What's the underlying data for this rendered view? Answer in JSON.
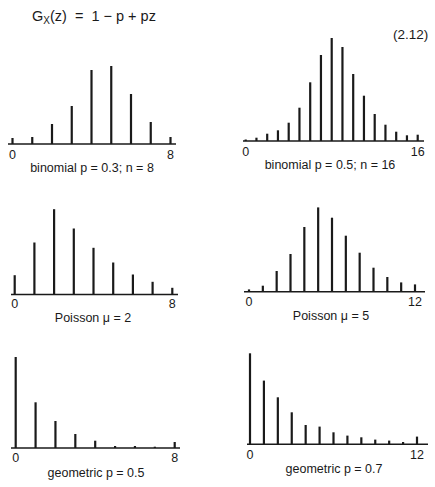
{
  "equation": {
    "lhs_main": "G",
    "lhs_sub": "X",
    "rhs": "(z)  =  1 − p + pz",
    "number": "(2.12)"
  },
  "style": {
    "ink": "#1a1a1a",
    "background": "#ffffff"
  },
  "chart_data": [
    {
      "type": "bar",
      "title": "binomial p = 0.3; n = 8",
      "x": [
        0,
        1,
        2,
        3,
        4,
        5,
        6,
        7,
        8
      ],
      "values": [
        6,
        7,
        20,
        38,
        74,
        78,
        50,
        22,
        7
      ],
      "xtick_labels": [
        "0",
        "8"
      ],
      "xlim": [
        0,
        8
      ],
      "units": "pixel heights (relative probability)",
      "layout": {
        "x0": 12.5,
        "x1": 170.5,
        "baseline": 144,
        "axis_from": 8,
        "axis_to": 176,
        "label_y": 148,
        "caption_x": 92,
        "caption_y": 161
      }
    },
    {
      "type": "bar",
      "title": "binomial p = 0.5; n = 16",
      "x": [
        0,
        1,
        2,
        3,
        4,
        5,
        6,
        7,
        8,
        9,
        10,
        11,
        12,
        13,
        14,
        15,
        16
      ],
      "values": [
        1.5,
        3.3,
        7.3,
        10.7,
        18.3,
        33.3,
        58.7,
        86,
        103,
        94,
        67,
        45.3,
        27,
        16.3,
        9.3,
        5.7,
        6.3
      ],
      "xtick_labels": [
        "0",
        "16"
      ],
      "xlim": [
        0,
        16
      ],
      "units": "pixel heights (relative probability)",
      "layout": {
        "x0": 245.7,
        "x1": 417.7,
        "baseline": 141,
        "axis_from": 243,
        "axis_to": 424,
        "label_y": 145,
        "caption_x": 330,
        "caption_y": 158
      }
    },
    {
      "type": "bar",
      "title": "Poisson μ = 2",
      "x": [
        0,
        1,
        2,
        3,
        4,
        5,
        6,
        7,
        8
      ],
      "values": [
        19.3,
        52,
        85.3,
        66,
        46.7,
        32,
        20,
        12.7,
        6.7
      ],
      "xtick_labels": [
        "0",
        "8"
      ],
      "xlim": [
        0,
        8
      ],
      "units": "pixel heights (relative probability)",
      "layout": {
        "x0": 14.7,
        "x1": 172.3,
        "baseline": 294.5,
        "axis_from": 11,
        "axis_to": 178,
        "label_y": 297,
        "caption_x": 93,
        "caption_y": 311
      }
    },
    {
      "type": "bar",
      "title": "Poisson μ = 5",
      "x": [
        0,
        1,
        2,
        3,
        4,
        5,
        6,
        7,
        8,
        9,
        10,
        11,
        12
      ],
      "values": [
        2.3,
        6,
        20.7,
        37.7,
        64.7,
        84.3,
        74,
        56,
        39,
        24,
        14.7,
        9.3,
        7.3
      ],
      "xtick_labels": [
        "0",
        "12"
      ],
      "xlim": [
        0,
        12
      ],
      "units": "pixel heights (relative probability)",
      "layout": {
        "x0": 249,
        "x1": 415,
        "baseline": 291.7,
        "axis_from": 244,
        "axis_to": 425,
        "label_y": 295,
        "caption_x": 331,
        "caption_y": 309
      }
    },
    {
      "type": "bar",
      "title": "geometric p = 0.5",
      "x": [
        0,
        1,
        2,
        3,
        4,
        5,
        6,
        7,
        8
      ],
      "values": [
        91,
        45.7,
        27,
        14,
        7.3,
        2,
        2,
        1.3,
        6
      ],
      "xtick_labels": [
        "0",
        "8"
      ],
      "xlim": [
        0,
        8
      ],
      "units": "pixel heights (relative probability)",
      "layout": {
        "x0": 15.7,
        "x1": 174.7,
        "baseline": 448,
        "axis_from": 11,
        "axis_to": 180,
        "label_y": 451,
        "caption_x": 96,
        "caption_y": 466
      }
    },
    {
      "type": "bar",
      "title": "geometric p = 0.7",
      "x": [
        0,
        1,
        2,
        3,
        4,
        5,
        6,
        7,
        8,
        9,
        10,
        11,
        12
      ],
      "values": [
        91,
        63.7,
        47,
        32,
        19.3,
        17.7,
        12,
        8.7,
        7,
        4.7,
        3.7,
        2.3,
        7.7
      ],
      "xtick_labels": [
        "0",
        "12"
      ],
      "xlim": [
        0,
        12
      ],
      "units": "pixel heights (relative probability)",
      "layout": {
        "x0": 250,
        "x1": 417,
        "baseline": 444.3,
        "axis_from": 247,
        "axis_to": 428,
        "label_y": 448,
        "caption_x": 334,
        "caption_y": 462
      }
    }
  ]
}
